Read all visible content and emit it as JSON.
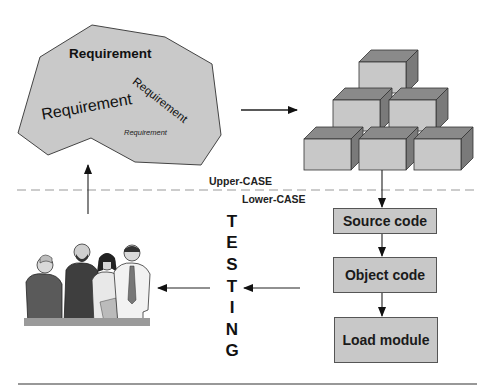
{
  "diagram": {
    "requirements": {
      "labels": [
        "Requirement",
        "Requirement",
        "Requirement",
        "Requirement"
      ],
      "fill": "#c9c9c9"
    },
    "boundary": {
      "upper_label": "Upper-CASE",
      "lower_label": "Lower-CASE"
    },
    "pipeline": {
      "steps": [
        {
          "label": "Source code"
        },
        {
          "label": "Object code"
        },
        {
          "label": "Load module"
        }
      ],
      "fill": "#c8c8c8"
    },
    "testing": {
      "word": "TESTING",
      "letters": [
        "T",
        "E",
        "S",
        "T",
        "I",
        "N",
        "G"
      ]
    },
    "icons": {
      "people": "users-group-clipart",
      "blocks": "stacked-cubes"
    },
    "colors": {
      "box_front": "#c8c8c8",
      "box_top": "#8a8a8a",
      "box_side": "#7a7a7a",
      "stroke": "#333333",
      "dash": "#999999"
    }
  }
}
